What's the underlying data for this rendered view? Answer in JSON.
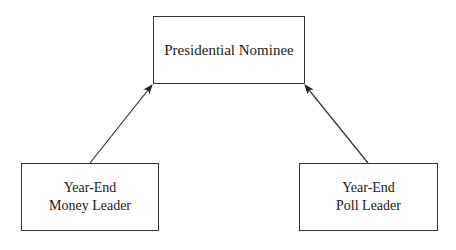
{
  "diagram": {
    "nodes": [
      {
        "id": "top",
        "lines": [
          "Presidential Nominee"
        ]
      },
      {
        "id": "left",
        "lines": [
          "Year-End",
          "Money Leader"
        ]
      },
      {
        "id": "right",
        "lines": [
          "Year-End",
          "Poll Leader"
        ]
      }
    ],
    "edges": [
      {
        "from": "left",
        "to": "top",
        "style": "arrow"
      },
      {
        "from": "right",
        "to": "top",
        "style": "arrow"
      }
    ],
    "colors": {
      "line": "#333333",
      "background": "#ffffff",
      "text": "#1a1a1a"
    }
  }
}
